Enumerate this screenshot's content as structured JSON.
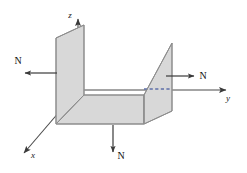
{
  "figure": {
    "background_color": "#ffffff",
    "line_color": "#4a4a4a",
    "panel_fill": "#d8d8d8",
    "panel_stroke": "#8a8a8a",
    "text_color": "#111111"
  },
  "axes": {
    "z": {
      "label": "z",
      "direction": "up"
    },
    "y": {
      "label": "y",
      "direction": "right"
    },
    "x": {
      "label": "x",
      "direction": "down-left"
    }
  },
  "forces": [
    {
      "id": "left",
      "label": "N",
      "direction": "left"
    },
    {
      "id": "right",
      "label": "N",
      "direction": "right"
    },
    {
      "id": "bottom",
      "label": "N",
      "direction": "down"
    }
  ],
  "surfaces": [
    {
      "id": "left-web",
      "name": "left vertical panel"
    },
    {
      "id": "floor",
      "name": "horizontal bottom panel"
    },
    {
      "id": "right-web",
      "name": "right vertical panel"
    }
  ],
  "hidden_edge": {
    "id": "dashed-edge",
    "style": "dashed"
  }
}
